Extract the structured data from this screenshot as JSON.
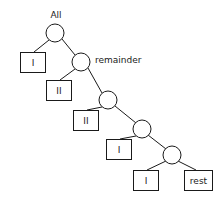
{
  "diagram": {
    "type": "binary-tree",
    "title": "",
    "background_color": "#ffffff",
    "stroke_color": "#1a1a1a",
    "fill_color": "#ffffff",
    "labels": {
      "root": "All",
      "second": "remainder"
    },
    "nodes": [
      {
        "id": "n1",
        "shape": "circle",
        "cx": 55,
        "cy": 33,
        "r": 9,
        "label": "All",
        "label_position": "above"
      },
      {
        "id": "n2",
        "shape": "circle",
        "cx": 81,
        "cy": 62,
        "r": 9,
        "label": "remainder",
        "label_position": "right"
      },
      {
        "id": "n3",
        "shape": "circle",
        "cx": 108,
        "cy": 100,
        "r": 9,
        "label": "",
        "label_position": "none"
      },
      {
        "id": "n4",
        "shape": "circle",
        "cx": 142,
        "cy": 129,
        "r": 9,
        "label": "",
        "label_position": "none"
      },
      {
        "id": "n5",
        "shape": "circle",
        "cx": 172,
        "cy": 155,
        "r": 9,
        "label": "",
        "label_position": "none"
      }
    ],
    "leaves": [
      {
        "id": "l1",
        "shape": "rect",
        "x": 20,
        "y": 52,
        "w": 25,
        "h": 20,
        "text": "I"
      },
      {
        "id": "l2",
        "shape": "rect",
        "x": 46,
        "y": 80,
        "w": 25,
        "h": 20,
        "text": "II"
      },
      {
        "id": "l3",
        "shape": "rect",
        "x": 73,
        "y": 110,
        "w": 25,
        "h": 20,
        "text": "II"
      },
      {
        "id": "l4",
        "shape": "rect",
        "x": 106,
        "y": 139,
        "w": 25,
        "h": 20,
        "text": "I"
      },
      {
        "id": "l5",
        "shape": "rect",
        "x": 133,
        "y": 170,
        "w": 25,
        "h": 20,
        "text": "I"
      },
      {
        "id": "l6",
        "shape": "rect",
        "x": 184,
        "y": 170,
        "w": 28,
        "h": 20,
        "text": "rest"
      }
    ],
    "edges": [
      {
        "id": "e1",
        "from": "n1",
        "to": "l1",
        "x1": 49,
        "y1": 40,
        "x2": 34,
        "y2": 52
      },
      {
        "id": "e2",
        "from": "n1",
        "to": "n2",
        "x1": 62,
        "y1": 39,
        "x2": 75,
        "y2": 55
      },
      {
        "id": "e3",
        "from": "n2",
        "to": "l2",
        "x1": 75,
        "y1": 69,
        "x2": 60,
        "y2": 80
      },
      {
        "id": "e4",
        "from": "n2",
        "to": "n3",
        "x1": 88,
        "y1": 68,
        "x2": 102,
        "y2": 93
      },
      {
        "id": "e5",
        "from": "n3",
        "to": "l3",
        "x1": 102,
        "y1": 107,
        "x2": 87,
        "y2": 110
      },
      {
        "id": "e6",
        "from": "n3",
        "to": "n4",
        "x1": 115,
        "y1": 106,
        "x2": 136,
        "y2": 123
      },
      {
        "id": "e7",
        "from": "n4",
        "to": "l4",
        "x1": 136,
        "y1": 136,
        "x2": 120,
        "y2": 139
      },
      {
        "id": "e8",
        "from": "n4",
        "to": "n5",
        "x1": 148,
        "y1": 135,
        "x2": 166,
        "y2": 149
      },
      {
        "id": "e9",
        "from": "n5",
        "to": "l5",
        "x1": 166,
        "y1": 161,
        "x2": 147,
        "y2": 170
      },
      {
        "id": "e10",
        "from": "n5",
        "to": "l6",
        "x1": 178,
        "y1": 161,
        "x2": 196,
        "y2": 170
      }
    ]
  }
}
